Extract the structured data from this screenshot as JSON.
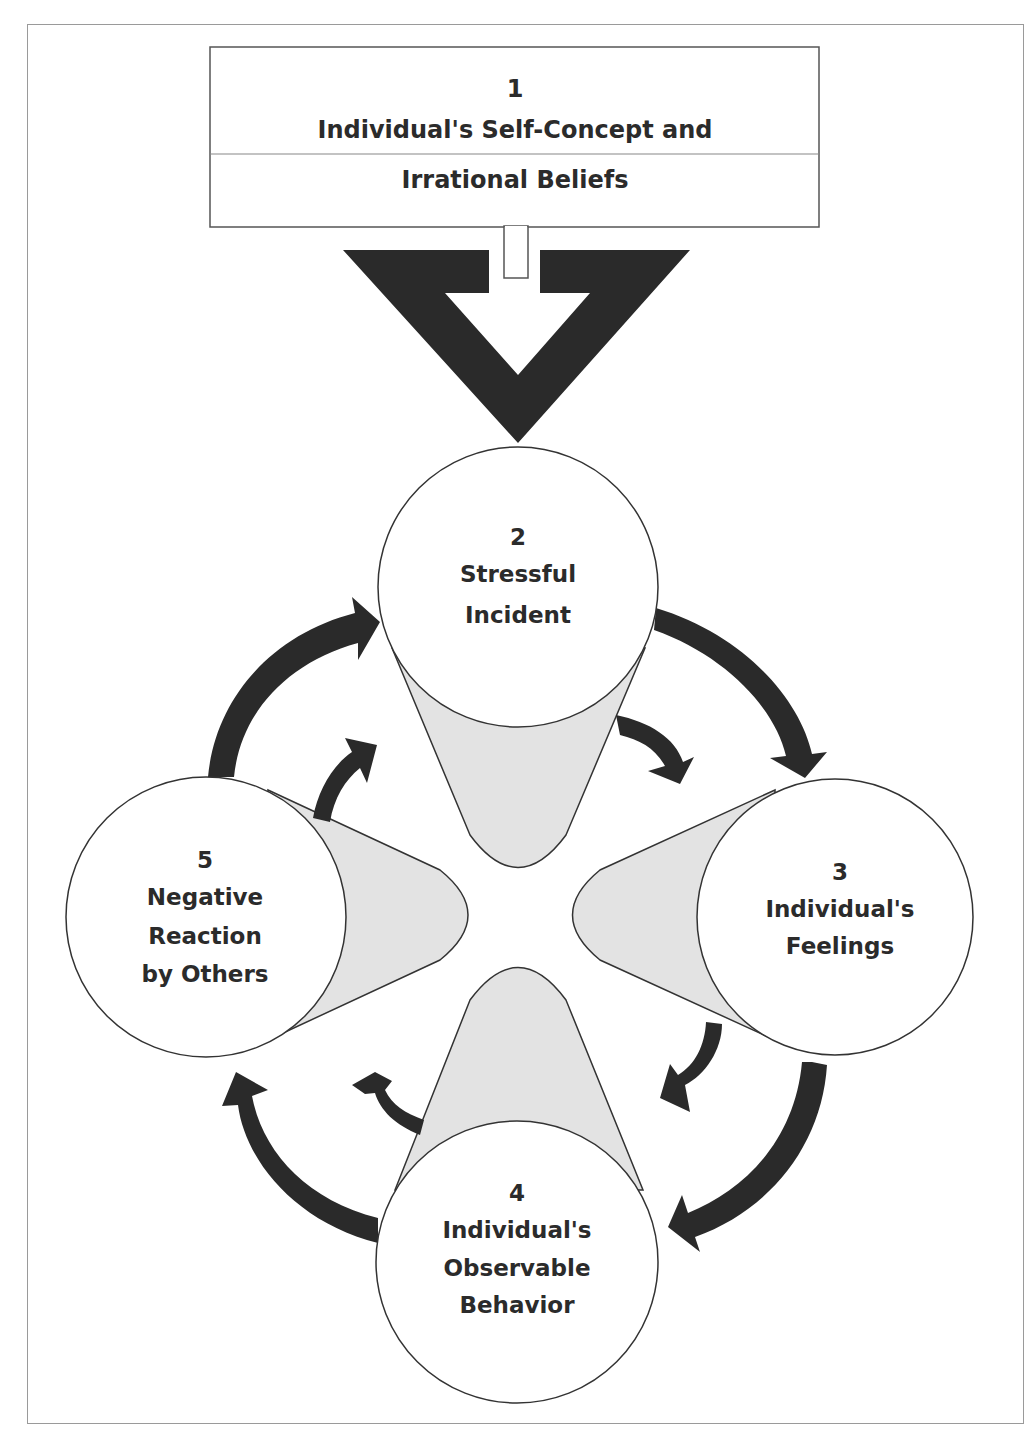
{
  "title_box": {
    "number": "1",
    "line1": "Individual's Self-Concept and",
    "line2": "Irrational Beliefs"
  },
  "nodes": [
    {
      "id": 2,
      "number": "2",
      "lines": [
        "Stressful",
        "Incident"
      ]
    },
    {
      "id": 3,
      "number": "3",
      "lines": [
        "Individual's",
        "Feelings"
      ]
    },
    {
      "id": 4,
      "number": "4",
      "lines": [
        "Individual's",
        "Observable",
        "Behavior"
      ]
    },
    {
      "id": 5,
      "number": "5",
      "lines": [
        "Negative",
        "Reaction",
        "by Others"
      ]
    }
  ],
  "colors": {
    "arrow": "#2a2a2a",
    "cone_fill": "#e3e3e3",
    "outline": "#3a3a3a",
    "frame": "#9a9a9a",
    "text": "#2b2b2b"
  }
}
